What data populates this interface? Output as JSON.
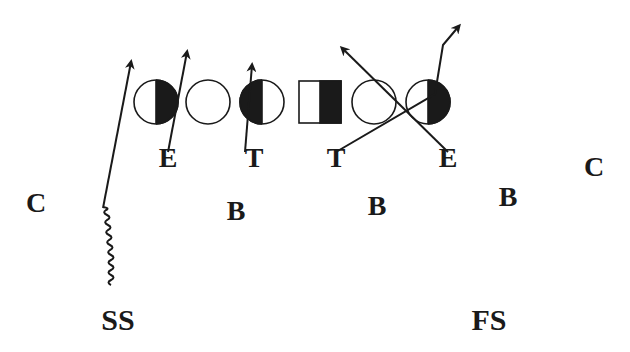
{
  "diagram": {
    "type": "football-play",
    "colors": {
      "ink": "#1a1a1a",
      "background": "#ffffff"
    },
    "offensive_line": [
      {
        "id": "ol1",
        "shape": "circle",
        "fill": "right-half",
        "cx": 156,
        "cy": 102,
        "r": 22
      },
      {
        "id": "ol2",
        "shape": "circle",
        "fill": "none",
        "cx": 208,
        "cy": 102,
        "r": 22
      },
      {
        "id": "ol3",
        "shape": "circle",
        "fill": "left-half",
        "cx": 262,
        "cy": 102,
        "r": 22
      },
      {
        "id": "center",
        "shape": "square",
        "fill": "right-half",
        "x": 299,
        "y": 81,
        "size": 42
      },
      {
        "id": "ol4",
        "shape": "circle",
        "fill": "none",
        "cx": 374,
        "cy": 102,
        "r": 22
      },
      {
        "id": "ol5",
        "shape": "circle",
        "fill": "right-half",
        "cx": 428,
        "cy": 102,
        "r": 22
      }
    ],
    "defense_labels": [
      {
        "id": "left-end",
        "text": "E",
        "x": 168,
        "y": 167
      },
      {
        "id": "left-tackle",
        "text": "T",
        "x": 254,
        "y": 167
      },
      {
        "id": "right-tackle",
        "text": "T",
        "x": 336,
        "y": 167
      },
      {
        "id": "right-end",
        "text": "E",
        "x": 448,
        "y": 167
      },
      {
        "id": "left-corner",
        "text": "C",
        "x": 36,
        "y": 212
      },
      {
        "id": "left-backer",
        "text": "B",
        "x": 236,
        "y": 220
      },
      {
        "id": "middle-backer",
        "text": "B",
        "x": 377,
        "y": 215
      },
      {
        "id": "right-backer",
        "text": "B",
        "x": 508,
        "y": 206
      },
      {
        "id": "right-corner",
        "text": "C",
        "x": 594,
        "y": 176
      },
      {
        "id": "strong-safety",
        "text": "SS",
        "x": 118,
        "y": 330
      },
      {
        "id": "free-safety",
        "text": "FS",
        "x": 489,
        "y": 330
      }
    ],
    "routes": [
      {
        "id": "ss-route",
        "kind": "motion-then-blitz",
        "points": "103,208 131,62"
      },
      {
        "id": "left-end-route",
        "kind": "rush",
        "points": "168,152 187,52"
      },
      {
        "id": "left-tackle-route",
        "kind": "rush",
        "points": "245,152 252,65"
      },
      {
        "id": "right-tackle-route",
        "kind": "stunt",
        "points": "336,152 435,94 443,45 459,26"
      },
      {
        "id": "right-end-route",
        "kind": "stunt",
        "points": "448,152 342,48"
      }
    ]
  }
}
